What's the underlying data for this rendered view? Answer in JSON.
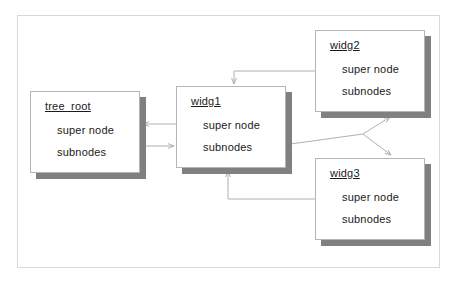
{
  "diagram": {
    "frame": {
      "name": "outer-frame",
      "x": 17,
      "y": 15,
      "width": 423,
      "height": 253,
      "border_color": "#d8d8d8",
      "background": "#ffffff"
    },
    "style": {
      "node_border_color": "#b5b5b5",
      "node_background": "#ffffff",
      "node_shadow_color": "#808080",
      "edge_color": "#b0b0b0",
      "text_color": "#1a1a1a"
    },
    "nodes": [
      {
        "id": "tree_root",
        "title": "tree_root",
        "fields": [
          "super node",
          "subnodes"
        ],
        "x": 30,
        "y": 91,
        "width": 110,
        "height": 82
      },
      {
        "id": "widg1",
        "title": "widg1",
        "fields": [
          "super node",
          "subnodes"
        ],
        "x": 176,
        "y": 86,
        "width": 110,
        "height": 82
      },
      {
        "id": "widg2",
        "title": "widg2",
        "fields": [
          "super node",
          "subnodes"
        ],
        "x": 315,
        "y": 30,
        "width": 110,
        "height": 82
      },
      {
        "id": "widg3",
        "title": "widg3",
        "fields": [
          "super node",
          "subnodes"
        ],
        "x": 315,
        "y": 158,
        "width": 110,
        "height": 82
      }
    ],
    "edges": [
      {
        "id": "widg1-super-to-tree_root",
        "from": "widg1.super node",
        "to": "tree_root.super node",
        "label": "",
        "arrow": "end"
      },
      {
        "id": "tree_root-subnodes-to-widg1",
        "from": "tree_root.subnodes",
        "to": "widg1.subnodes",
        "label": "",
        "arrow": "end"
      },
      {
        "id": "widg2-super-to-widg1",
        "from": "widg2.super node",
        "to": "widg1.top",
        "label": "",
        "arrow": "end"
      },
      {
        "id": "widg3-super-to-widg1",
        "from": "widg3.super node",
        "to": "widg1.bottom",
        "label": "",
        "arrow": "end"
      },
      {
        "id": "widg1-subnodes-to-widg2",
        "from": "widg1.subnodes",
        "to": "widg2.bottom",
        "label": "",
        "arrow": "end"
      },
      {
        "id": "widg1-subnodes-to-widg3",
        "from": "widg1.subnodes",
        "to": "widg3.top",
        "label": "",
        "arrow": "end"
      }
    ]
  }
}
